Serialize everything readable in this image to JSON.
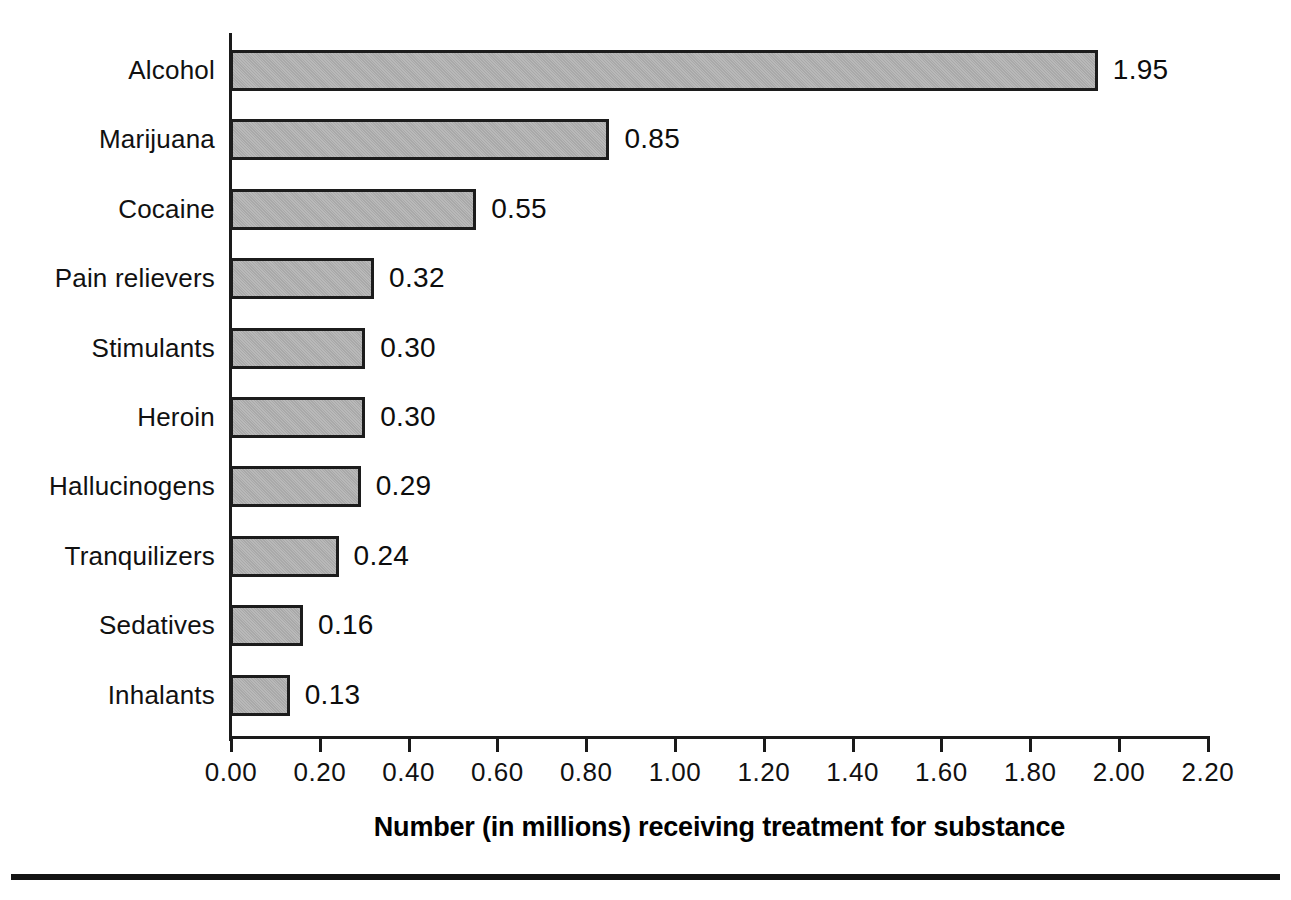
{
  "chart_data": {
    "type": "bar",
    "orientation": "horizontal",
    "title": "",
    "xlabel": "Number (in millions) receiving treatment for substance",
    "ylabel": "",
    "xlim": [
      0.0,
      2.2
    ],
    "xticks": [
      "0.00",
      "0.20",
      "0.40",
      "0.60",
      "0.80",
      "1.00",
      "1.20",
      "1.40",
      "1.60",
      "1.80",
      "2.00",
      "2.20"
    ],
    "xtick_values": [
      0.0,
      0.2,
      0.4,
      0.6,
      0.8,
      1.0,
      1.2,
      1.4,
      1.6,
      1.8,
      2.0,
      2.2
    ],
    "grid": false,
    "legend": false,
    "bar_fill_color": "#a9a9a9",
    "bar_border_color": "#1c1c1c",
    "axis_color": "#1a1a1a",
    "categories": [
      "Alcohol",
      "Marijuana",
      "Cocaine",
      "Pain relievers",
      "Stimulants",
      "Heroin",
      "Hallucinogens",
      "Tranquilizers",
      "Sedatives",
      "Inhalants"
    ],
    "values": [
      1.95,
      0.85,
      0.55,
      0.32,
      0.3,
      0.3,
      0.29,
      0.24,
      0.16,
      0.13
    ],
    "value_labels": [
      "1.95",
      "0.85",
      "0.55",
      "0.32",
      "0.30",
      "0.30",
      "0.29",
      "0.24",
      "0.16",
      "0.13"
    ]
  }
}
